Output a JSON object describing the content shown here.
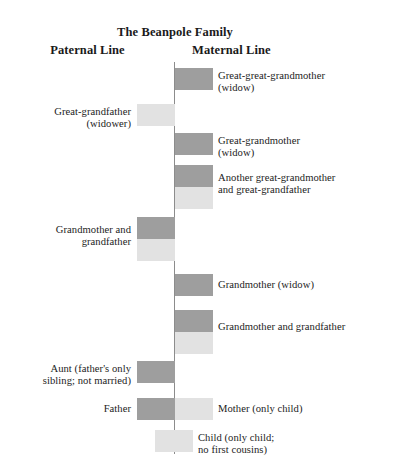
{
  "title": "The Beanpole Family",
  "columns": {
    "paternal": "Paternal Line",
    "maternal": "Maternal Line"
  },
  "colors": {
    "female": "#9e9e9e",
    "male": "#e2e2e2",
    "spine": "#8c8c8c",
    "background": "#ffffff",
    "text": "#1c1c1c"
  },
  "generations": [
    {
      "id": "great-great-grandmother",
      "side": "maternal",
      "label": "Great-great-grandmother\n(widow)",
      "label_line1": "Great-great-grandmother",
      "label_line2": "(widow)",
      "bars": [
        {
          "sex": "female",
          "x": 175,
          "y": 68,
          "w": 38,
          "h": 22
        }
      ],
      "label_x": 218,
      "label_y": 70
    },
    {
      "id": "great-grandfather",
      "side": "paternal",
      "label_line1": "Great-grandfather",
      "label_line2": "(widower)",
      "bars": [
        {
          "sex": "male",
          "x": 137,
          "y": 104,
          "w": 38,
          "h": 22
        }
      ],
      "label_x": 8,
      "label_y": 106,
      "label_w": 123
    },
    {
      "id": "great-grandmother",
      "side": "maternal",
      "label_line1": "Great-grandmother",
      "label_line2": "(widow)",
      "bars": [
        {
          "sex": "female",
          "x": 175,
          "y": 133,
          "w": 38,
          "h": 22
        }
      ],
      "label_x": 218,
      "label_y": 135
    },
    {
      "id": "another-great-grandparents",
      "side": "maternal",
      "label_line1": "Another great-grandmother",
      "label_line2": "and great-grandfather",
      "bars": [
        {
          "sex": "female",
          "x": 175,
          "y": 165,
          "w": 38,
          "h": 22
        },
        {
          "sex": "male",
          "x": 175,
          "y": 187,
          "w": 38,
          "h": 22
        }
      ],
      "label_x": 218,
      "label_y": 172
    },
    {
      "id": "paternal-grandparents",
      "side": "paternal",
      "label_line1": "Grandmother and",
      "label_line2": "grandfather",
      "bars": [
        {
          "sex": "female",
          "x": 137,
          "y": 217,
          "w": 38,
          "h": 22
        },
        {
          "sex": "male",
          "x": 137,
          "y": 239,
          "w": 38,
          "h": 22
        }
      ],
      "label_x": 8,
      "label_y": 224,
      "label_w": 123
    },
    {
      "id": "maternal-grandmother",
      "side": "maternal",
      "label_line1": "Grandmother (widow)",
      "label_line2": "",
      "bars": [
        {
          "sex": "female",
          "x": 175,
          "y": 274,
          "w": 38,
          "h": 22
        }
      ],
      "label_x": 218,
      "label_y": 279
    },
    {
      "id": "maternal-grandparents",
      "side": "maternal",
      "label_line1": "Grandmother and grandfather",
      "label_line2": "",
      "bars": [
        {
          "sex": "female",
          "x": 175,
          "y": 310,
          "w": 38,
          "h": 22
        },
        {
          "sex": "male",
          "x": 175,
          "y": 332,
          "w": 38,
          "h": 22
        }
      ],
      "label_x": 218,
      "label_y": 321
    },
    {
      "id": "aunt",
      "side": "paternal",
      "label_line1": "Aunt (father's only",
      "label_line2": "sibling; not married)",
      "bars": [
        {
          "sex": "female",
          "x": 137,
          "y": 361,
          "w": 38,
          "h": 22
        }
      ],
      "label_x": 8,
      "label_y": 363,
      "label_w": 123
    },
    {
      "id": "father",
      "side": "paternal",
      "label_line1": "Father",
      "label_line2": "",
      "bars": [
        {
          "sex": "female",
          "x": 137,
          "y": 398,
          "w": 38,
          "h": 22
        }
      ],
      "label_x": 8,
      "label_y": 403,
      "label_w": 123
    },
    {
      "id": "mother",
      "side": "maternal",
      "label_line1": "Mother (only child)",
      "label_line2": "",
      "bars": [
        {
          "sex": "male",
          "x": 175,
          "y": 398,
          "w": 38,
          "h": 22
        }
      ],
      "label_x": 218,
      "label_y": 403
    },
    {
      "id": "child",
      "side": "center",
      "label_line1": "Child (only child;",
      "label_line2": "no first cousins)",
      "bars": [
        {
          "sex": "male",
          "x": 155,
          "y": 430,
          "w": 38,
          "h": 22
        }
      ],
      "label_x": 198,
      "label_y": 432
    }
  ]
}
